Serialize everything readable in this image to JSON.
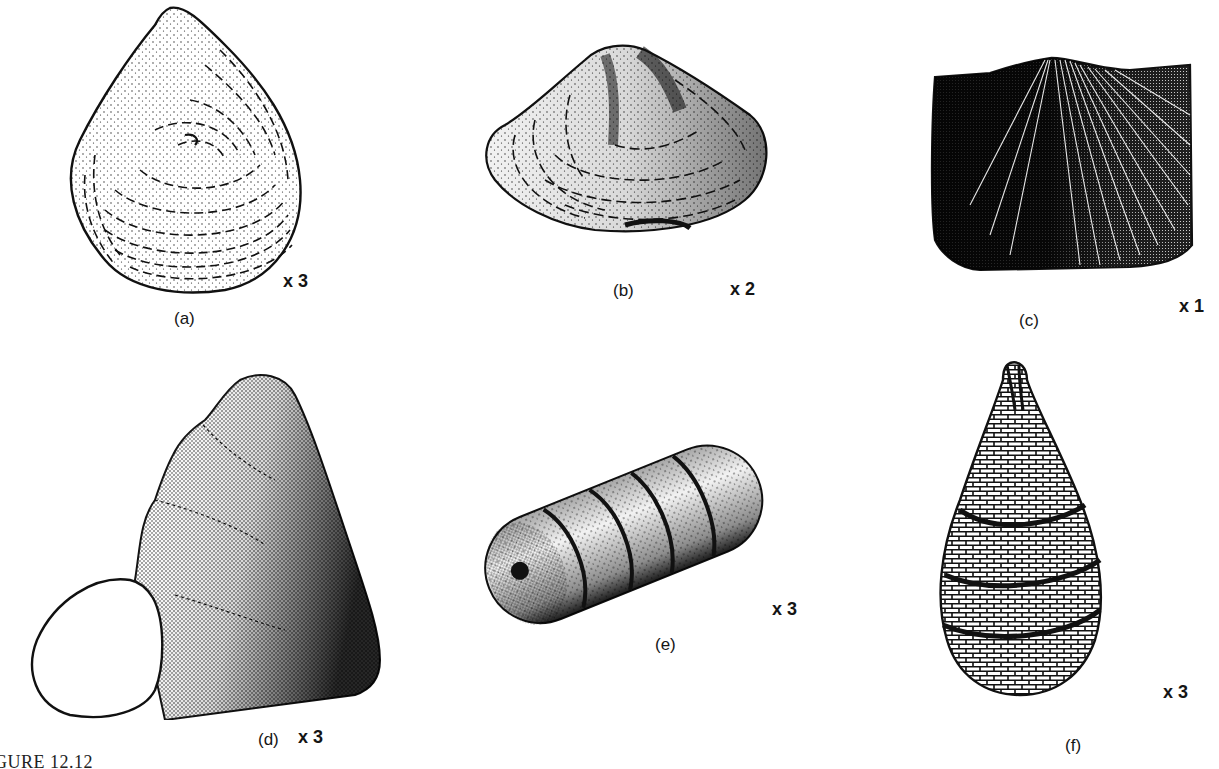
{
  "figure": {
    "caption": "GURE 12.12",
    "panels": [
      {
        "id": "a",
        "label": "(a)",
        "magnification": "x 3",
        "subject": "rounded triangular bivalve shell with concentric growth lines"
      },
      {
        "id": "b",
        "label": "(b)",
        "magnification": "x 2",
        "subject": "wide bivalve shell with central ridge"
      },
      {
        "id": "c",
        "label": "(c)",
        "magnification": "x 1",
        "subject": "brachiopod shell with radial ribs, dark stipple"
      },
      {
        "id": "d",
        "label": "(d)",
        "magnification": "x 3",
        "subject": "high-spired gastropod shell with open aperture"
      },
      {
        "id": "e",
        "label": "(e)",
        "magnification": "x 3",
        "subject": "segmented cylindrical fossil with central hole"
      },
      {
        "id": "f",
        "label": "(f)",
        "magnification": "x 3",
        "subject": "teardrop-shaped fossil with net-like surface and spiral bands"
      }
    ]
  }
}
